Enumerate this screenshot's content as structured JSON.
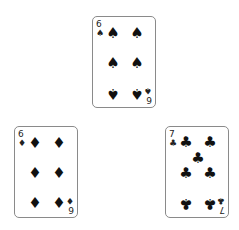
{
  "table": {
    "background": "#ffffff",
    "cards": [
      {
        "name": "top-card",
        "rank": "6",
        "suit": "spades",
        "suit_glyph": "♠",
        "color": "#111111",
        "position": {
          "left": 92,
          "top": 16
        }
      },
      {
        "name": "left-card",
        "rank": "6",
        "suit": "diamonds",
        "suit_glyph": "♦",
        "color": "#111111",
        "position": {
          "left": 14,
          "top": 126
        }
      },
      {
        "name": "right-card",
        "rank": "7",
        "suit": "clubs",
        "suit_glyph": "♣",
        "color": "#111111",
        "position": {
          "left": 165,
          "top": 126
        }
      }
    ]
  }
}
